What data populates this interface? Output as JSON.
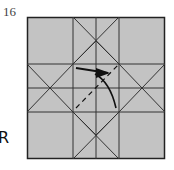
{
  "diagram": {
    "step_number": "16",
    "side_label": "R",
    "paper_color": "#c3c3c3",
    "line_color": "#222222",
    "square": {
      "x": 27,
      "y": 17,
      "width": 138,
      "height": 142
    },
    "grid_x": [
      27,
      73,
      96,
      119,
      165
    ],
    "grid_y": [
      17,
      64,
      88,
      112,
      159
    ],
    "annotations": {
      "fold_arrow": "curved arrow pointing right",
      "valley_fold": "dashed diagonal line"
    }
  }
}
